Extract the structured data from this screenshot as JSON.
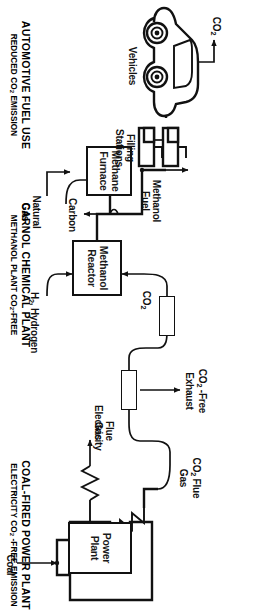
{
  "figure": {
    "orientation": "rotated-90-clockwise"
  },
  "sections": [
    {
      "id": "coal-fired-power-plant",
      "main": "COAL-FIRED POWER PLANT",
      "sub_prefix": "ELECTRICITY CO",
      "sub_subscript": "2",
      "sub_suffix": " -FREE EMISSION"
    },
    {
      "id": "carnol-chemical-plant",
      "main": "CARNOL CHEMICAL PLANT",
      "sub_prefix": "METHANOL PLANT CO",
      "sub_subscript": "2",
      "sub_suffix": "-FREE"
    },
    {
      "id": "automotive-fuel-use",
      "main": "AUTOMOTIVE FUEL USE",
      "sub_prefix": "REDUCED CO",
      "sub_subscript": "2",
      "sub_suffix": " EMISSION"
    }
  ],
  "units": {
    "power_plant": {
      "line1": "Power",
      "line2": "Plant"
    },
    "methanol_reactor": {
      "line1": "Methanol",
      "line2": "Reactor"
    },
    "methane_furnace": {
      "line1": "Methane",
      "line2": "Furnace"
    },
    "filling_stations": {
      "line1": "Filling",
      "line2": "Stations"
    },
    "vehicles": {
      "label": "Vehicles"
    },
    "scrubber_upper": {
      "label": ""
    },
    "scrubber_lower": {
      "label": ""
    }
  },
  "streams": {
    "coal": "Coal",
    "electricity": "Electricity",
    "co2_flue_gas": {
      "prefix": "CO",
      "subscript": "2",
      "suffix": " Flue",
      "line2": "Gas"
    },
    "flue_gas": {
      "line1": "Flue",
      "line2": "Gas"
    },
    "co2_free_exhaust": {
      "prefix": "CO",
      "subscript": "2",
      "suffix": " -Free",
      "line2": "Exhaust"
    },
    "co2_to_reactor": {
      "prefix": "CO",
      "subscript": "2"
    },
    "hydrogen": {
      "prefix": "H",
      "subscript": "2",
      "suffix": ", Hydrogen"
    },
    "natural_gas": {
      "line1": "Natural",
      "line2": "Gas"
    },
    "carbon": "Carbon",
    "methanol_fuel": {
      "line1": "Methanol",
      "line2": "Fuel"
    },
    "co2_emission": {
      "prefix": "CO",
      "subscript": "2"
    }
  },
  "colors": {
    "ink": "#111111",
    "paper": "#ffffff"
  }
}
